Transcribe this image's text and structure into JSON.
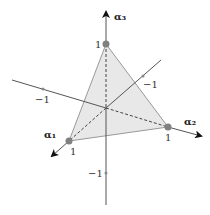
{
  "diagram": {
    "title": "",
    "axes": [
      {
        "name": "alpha1",
        "label": "α",
        "subscript": "1",
        "positive_tick": "1"
      },
      {
        "name": "alpha2",
        "label": "α",
        "subscript": "2",
        "positive_tick": "1",
        "negative_tick": "−1"
      },
      {
        "name": "alpha3",
        "label": "α",
        "subscript": "3",
        "positive_tick": "1",
        "negative_tick": "−1"
      }
    ],
    "labels": {
      "alpha1": "α₁",
      "alpha2": "α₂",
      "alpha3": "α₃",
      "one_a3": "1",
      "one_a1": "1",
      "one_a2": "1",
      "neg_left": "−1",
      "neg_diag": "−1",
      "neg_bottom": "−1"
    },
    "simplex": {
      "vertices": [
        "(1,0,0)",
        "(0,1,0)",
        "(0,0,1)"
      ],
      "fill": "#e6e6e6",
      "edge": "#888888"
    },
    "colors": {
      "axis": "#555555",
      "point": "#808080",
      "dashed": "#444444"
    }
  }
}
